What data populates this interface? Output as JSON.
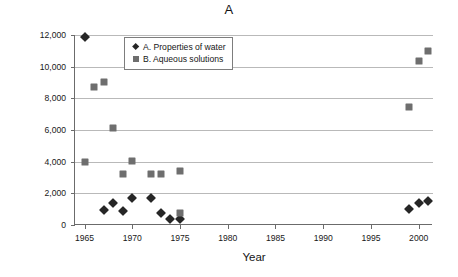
{
  "chart_data": {
    "type": "scatter",
    "title": "A",
    "xlabel": "Year",
    "ylabel": "Funding ($ thousands)",
    "xlim": [
      1964,
      2001.5
    ],
    "ylim": [
      0,
      12000
    ],
    "xticks": [
      1965,
      1970,
      1975,
      1980,
      1985,
      1990,
      1995,
      2000
    ],
    "xtick_labels": [
      "1965",
      "1970",
      "1975",
      "1980",
      "1985",
      "1990",
      "1995",
      "2000"
    ],
    "yticks": [
      0,
      2000,
      4000,
      6000,
      8000,
      10000,
      12000
    ],
    "ytick_labels": [
      "0",
      "2,000",
      "4,000",
      "6,000",
      "8,000",
      "10,000",
      "12,000"
    ],
    "grid": "horizontal",
    "legend_position": "upper-center",
    "series": [
      {
        "name": "A. Properties of water",
        "marker": "diamond",
        "color": "#262626",
        "points": [
          {
            "x": 1965,
            "y": 11900
          },
          {
            "x": 1967,
            "y": 930
          },
          {
            "x": 1968,
            "y": 1400
          },
          {
            "x": 1969,
            "y": 880
          },
          {
            "x": 1970,
            "y": 1680
          },
          {
            "x": 1972,
            "y": 1680
          },
          {
            "x": 1973,
            "y": 760
          },
          {
            "x": 1974,
            "y": 400
          },
          {
            "x": 1975,
            "y": 410
          },
          {
            "x": 1999,
            "y": 1010
          },
          {
            "x": 2000,
            "y": 1400
          },
          {
            "x": 2001,
            "y": 1540
          }
        ]
      },
      {
        "name": "B. Aqueous solutions",
        "marker": "square",
        "color": "#6e6e6e",
        "points": [
          {
            "x": 1965,
            "y": 4000
          },
          {
            "x": 1966,
            "y": 8700
          },
          {
            "x": 1967,
            "y": 9050
          },
          {
            "x": 1968,
            "y": 6100
          },
          {
            "x": 1969,
            "y": 3250
          },
          {
            "x": 1970,
            "y": 4050
          },
          {
            "x": 1972,
            "y": 3200
          },
          {
            "x": 1973,
            "y": 3210
          },
          {
            "x": 1975,
            "y": 3430
          },
          {
            "x": 1975,
            "y": 760
          },
          {
            "x": 1999,
            "y": 7450
          },
          {
            "x": 2000,
            "y": 10330
          },
          {
            "x": 2001,
            "y": 11020
          }
        ]
      }
    ]
  }
}
